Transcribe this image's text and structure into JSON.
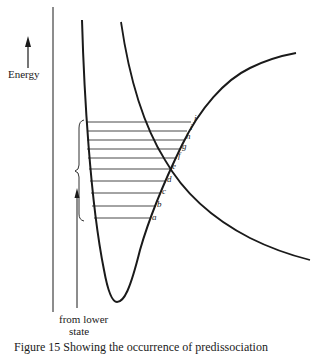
{
  "figure": {
    "energy_label": "Energy",
    "from_label_line1": "from lower",
    "from_label_line2": "state",
    "caption": "Figure 15 Showing the occurrence of predissociation",
    "level_labels": [
      "a",
      "b",
      "c",
      "d",
      "e",
      "f",
      "g",
      "h",
      "i",
      "j"
    ],
    "curves": [
      "bound-state-potential-well",
      "repulsive-state-curve"
    ],
    "colors": {
      "ink": "#1a1a1a",
      "background": "#ffffff"
    }
  }
}
